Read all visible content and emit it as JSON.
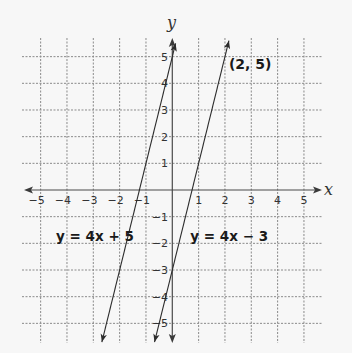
{
  "chart_data": {
    "type": "line",
    "title": "",
    "xlabel": "x",
    "ylabel": "y",
    "xlim": [
      -5,
      5
    ],
    "ylim": [
      -5,
      5
    ],
    "grid": true,
    "x_ticks": [
      -5,
      -4,
      -3,
      -2,
      -1,
      1,
      2,
      3,
      4,
      5
    ],
    "y_ticks": [
      5,
      4,
      3,
      2,
      1,
      -1,
      -2,
      -3,
      -4,
      -5
    ],
    "series": [
      {
        "name": "y = 4x + 5",
        "slope": 4,
        "intercept": 5,
        "x": [
          -2.675,
          0.125
        ],
        "y": [
          -5.7,
          5.5
        ],
        "label": "y = 4x + 5",
        "label_pos": [
          -4.3,
          -3.4
        ]
      },
      {
        "name": "y = 4x − 3",
        "slope": 4,
        "intercept": -3,
        "x": [
          -0.675,
          2.15
        ],
        "y": [
          -5.7,
          5.6
        ],
        "label": "y = 4x − 3",
        "label_pos": [
          0.8,
          -3.4
        ]
      }
    ],
    "annotations": [
      {
        "text": "(2, 5)",
        "x": 2.15,
        "y": 4.55
      }
    ]
  }
}
